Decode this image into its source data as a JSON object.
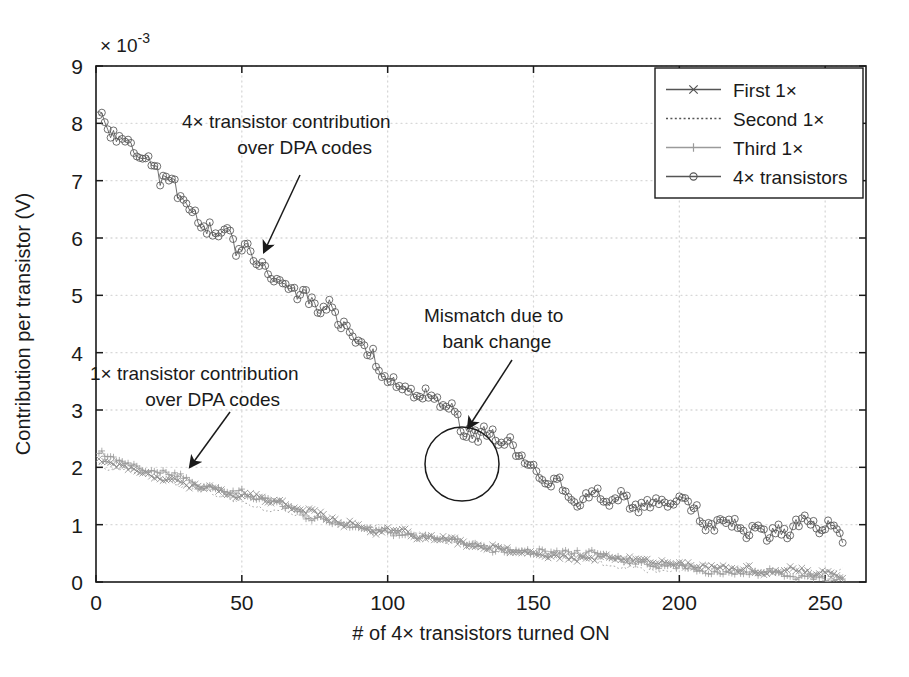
{
  "chart_data": {
    "type": "line",
    "title": "",
    "xlabel": "# of 4× transistors turned ON",
    "ylabel": "Contribution per transistor (V)",
    "y_exponent_label": "× 10",
    "y_exponent_power": "-3",
    "y_scale": 0.001,
    "xlim": [
      0,
      264
    ],
    "ylim": [
      0,
      9
    ],
    "xticks": [
      0,
      50,
      100,
      150,
      200,
      250
    ],
    "yticks": [
      0,
      1,
      2,
      3,
      4,
      5,
      6,
      7,
      8,
      9
    ],
    "grid": true,
    "grid_style": "dotted",
    "legend_position": "top-right",
    "series": [
      {
        "name": "First 1×",
        "marker": "x",
        "linestyle": "solid",
        "color": "#888888",
        "x_start": 1,
        "x_end": 256,
        "y_start": 2.15,
        "y_end": 0.16,
        "noise": 0.055,
        "curvature": 0.72
      },
      {
        "name": "Second 1×",
        "marker": "none",
        "linestyle": "dotted",
        "color": "#909090",
        "x_start": 1,
        "x_end": 256,
        "y_start": 2.1,
        "y_end": 0.15,
        "noise": 0.05,
        "curvature": 0.72
      },
      {
        "name": "Third 1×",
        "marker": "plus",
        "linestyle": "solid",
        "color": "#9a9a9a",
        "x_start": 1,
        "x_end": 256,
        "y_start": 2.2,
        "y_end": 0.14,
        "noise": 0.06,
        "curvature": 0.72
      },
      {
        "name": "4× transistors",
        "marker": "circle",
        "linestyle": "solid",
        "color": "#555555",
        "x_start": 1,
        "x_end": 256,
        "y_start": 8.3,
        "y_end": 0.75,
        "noise": 0.16,
        "curvature": 0.68
      }
    ],
    "annotations": [
      {
        "id": "four-x-contribution",
        "lines": [
          "4× transistor contribution",
          "over DPA codes"
        ],
        "text_x": 182,
        "text_y": 128,
        "arrow_from_x": 300,
        "arrow_from_y": 175,
        "arrow_to_x": 264,
        "arrow_to_y": 252
      },
      {
        "id": "one-x-contribution",
        "lines": [
          "1× transistor contribution",
          "over DPA codes"
        ],
        "text_x": 90,
        "text_y": 380,
        "arrow_from_x": 230,
        "arrow_from_y": 412,
        "arrow_to_x": 190,
        "arrow_to_y": 467
      },
      {
        "id": "mismatch-bank-change",
        "lines": [
          "Mismatch due to",
          "bank change"
        ],
        "text_x": 424,
        "text_y": 322,
        "arrow_from_x": 512,
        "arrow_from_y": 360,
        "arrow_to_x": 468,
        "arrow_to_y": 428
      }
    ],
    "highlight_circle": {
      "id": "mismatch-highlight-circle",
      "cx": 462,
      "cy": 464,
      "r": 37
    },
    "colors": {
      "background": "#ffffff",
      "axis": "#1a1a1a",
      "grid": "#d8d8d8",
      "text": "#1a1a1a",
      "four_x_series": "#555555",
      "one_x_series": "#9a9a9a"
    }
  },
  "legend": {
    "items": [
      {
        "label": "First 1×",
        "marker": "x",
        "linestyle": "solid",
        "color": "#555555"
      },
      {
        "label": "Second 1×",
        "marker": "none",
        "linestyle": "dotted",
        "color": "#555555"
      },
      {
        "label": "Third 1×",
        "marker": "plus",
        "linestyle": "solid",
        "color": "#9a9a9a"
      },
      {
        "label": "4× transistors",
        "marker": "circle",
        "linestyle": "solid",
        "color": "#555555"
      }
    ]
  }
}
